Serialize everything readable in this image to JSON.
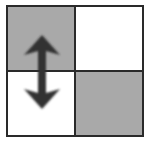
{
  "icon": {
    "name": "swap-vertical-grid",
    "cells": [
      {
        "fill": "#a9a9a9"
      },
      {
        "fill": "#ffffff"
      },
      {
        "fill": "#ffffff"
      },
      {
        "fill": "#a9a9a9"
      }
    ],
    "border_color": "#2a2a2a",
    "arrow_color": "#333333"
  }
}
